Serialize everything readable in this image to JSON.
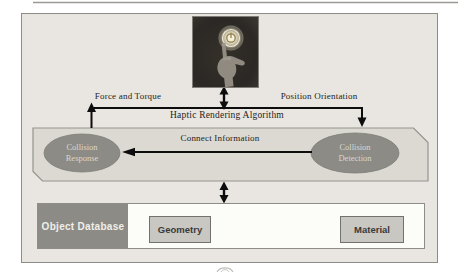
{
  "figure": {
    "type": "block-diagram",
    "topic": "Haptic rendering pipeline"
  },
  "hand_image": {
    "name": "fingertip-touching-glowing-power-symbol",
    "description": "dark photo of a hand, index finger raised touching a glowing ring"
  },
  "labels": {
    "force_and_torque": "Force and Torque",
    "position_orientation": "Position Orientation",
    "haptic_rendering_algorithm": "Haptic Rendering Algorithm",
    "connect_information": "Connect Information"
  },
  "nodes": {
    "collision_response": {
      "line1": "Collision",
      "line2": "Response"
    },
    "collision_detection": {
      "line1": "Collision",
      "line2": "Detection"
    },
    "object_database": {
      "label": "Object Database"
    },
    "geometry": {
      "label": "Geometry"
    },
    "material": {
      "label": "Material"
    }
  },
  "colors": {
    "canvas_bg": "#e9e6e1",
    "haptic_box_fill": "#dbd9d2",
    "haptic_box_border": "#95938d",
    "ellipse_fill": "#8c8b86",
    "ellipse_text": "#dad7cd",
    "db_header_fill": "#8c8b86",
    "db_header_text": "#f0efe9",
    "sub_box_fill": "#c9c7c1",
    "bottom_box_fill": "#fcfcf9",
    "arrow_color": "#0d0d0d"
  }
}
